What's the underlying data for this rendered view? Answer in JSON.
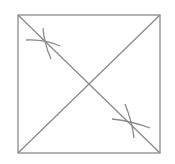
{
  "diagram": {
    "stroke_color": "#8a8a8a",
    "background": "#ffffff",
    "square": {
      "x": 18,
      "y": 15,
      "width": 142,
      "height": 138
    },
    "diagonals": [
      {
        "from": [
          18,
          15
        ],
        "to": [
          160,
          153
        ]
      },
      {
        "from": [
          160,
          15
        ],
        "to": [
          18,
          153
        ]
      }
    ],
    "arc_marks": [
      {
        "name": "upper-left-mark",
        "center": [
          45,
          42
        ]
      },
      {
        "name": "lower-right-mark",
        "center": [
          132,
          125
        ]
      }
    ]
  }
}
